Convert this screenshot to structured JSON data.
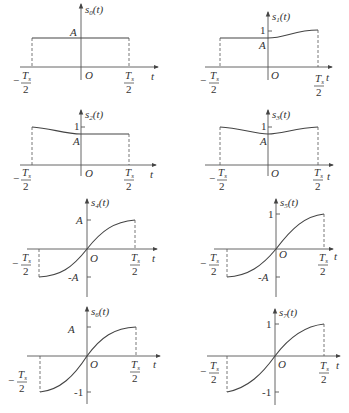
{
  "figure": {
    "panels": [
      {
        "id": "s0",
        "ylabel": "s",
        "sub": "0",
        "arg": "(t)",
        "ytick_top": "A",
        "ytick_bottom": "",
        "shape": "rectangular pulse, constant A on [-Ts/2, Ts/2]"
      },
      {
        "id": "s1",
        "ylabel": "s",
        "sub": "1",
        "arg": "(t)",
        "ytick_top": "1",
        "ytick_mid": "A",
        "shape": "flat at A for t<0, rising smoothly to 1 at Ts/2"
      },
      {
        "id": "s2",
        "ylabel": "s",
        "sub": "2",
        "arg": "(t)",
        "ytick_top": "1",
        "ytick_mid": "A",
        "shape": "starts at 1 at -Ts/2, falls to A at 0, flat at A afterwards"
      },
      {
        "id": "s3",
        "ylabel": "s",
        "sub": "3",
        "arg": "(t)",
        "ytick_top": "1",
        "ytick_mid": "A",
        "shape": "symmetric, 1 at edges, dips to A at 0"
      },
      {
        "id": "s4",
        "ylabel": "s",
        "sub": "4",
        "arg": "(t)",
        "ytick_top": "A",
        "ytick_bottom": "-A",
        "shape": "odd sine-like, -A to A"
      },
      {
        "id": "s5",
        "ylabel": "s",
        "sub": "5",
        "arg": "(t)",
        "ytick_top": "1",
        "ytick_bottom": "-A",
        "shape": "odd-like, -A at -Ts/2 to 1 at Ts/2"
      },
      {
        "id": "s6",
        "ylabel": "s",
        "sub": "6",
        "arg": "(t)",
        "ytick_top": "A",
        "ytick_bottom": "-1",
        "shape": "-1 at -Ts/2 to A at Ts/2"
      },
      {
        "id": "s7",
        "ylabel": "s",
        "sub": "7",
        "arg": "(t)",
        "ytick_top": "1",
        "ytick_bottom": "-1",
        "shape": "odd sine-like, -1 to 1"
      }
    ],
    "common": {
      "origin_label": "O",
      "t_label": "t",
      "left_bound": "-Ts/2",
      "right_bound": "Ts/2",
      "frac_num": "T",
      "frac_sub": "s",
      "frac_den": "2",
      "minus": "−"
    }
  }
}
